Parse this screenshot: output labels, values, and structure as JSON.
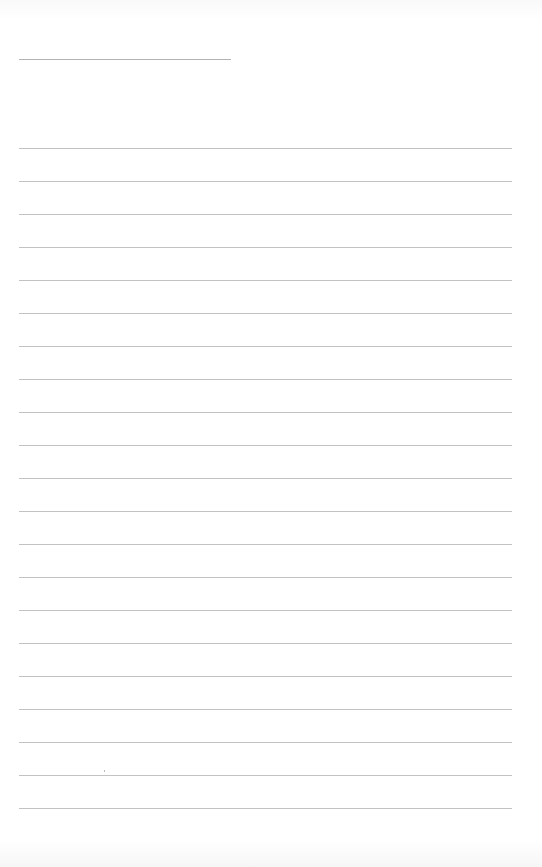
{
  "document": {
    "type": "blank lined writing page",
    "header_line": {
      "x": 19,
      "y": 59,
      "width": 212
    },
    "ruled_lines": {
      "count": 21,
      "first_y": 148,
      "spacing": 33,
      "x": 19,
      "width": 493
    },
    "colors": {
      "background": "#ffffff",
      "rule": "#a8a8a8"
    },
    "text": []
  }
}
